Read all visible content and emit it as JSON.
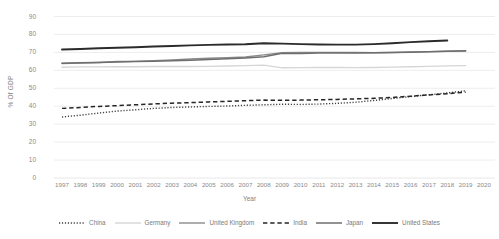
{
  "chart_data": {
    "type": "line",
    "title": "",
    "xlabel": "Year",
    "ylabel": "% Of GDP",
    "ylim": [
      0,
      90
    ],
    "ytick_step": 10,
    "grid": true,
    "legend_position": "bottom",
    "x": [
      1997,
      1998,
      1999,
      2000,
      2001,
      2002,
      2003,
      2004,
      2005,
      2006,
      2007,
      2008,
      2009,
      2010,
      2011,
      2012,
      2013,
      2014,
      2015,
      2016,
      2017,
      2018,
      2019,
      2020
    ],
    "xticks": [
      "1997",
      "1998",
      "1999",
      "2000",
      "2001",
      "2002",
      "2003",
      "2004",
      "2005",
      "2006",
      "2007",
      "2008",
      "2009",
      "2010",
      "2011",
      "2012",
      "2013",
      "2014",
      "2015",
      "2016",
      "2017",
      "2018",
      "2019",
      "2020"
    ],
    "yticks": [
      "0",
      "10",
      "20",
      "30",
      "40",
      "50",
      "60",
      "70",
      "80",
      "90"
    ],
    "series": [
      {
        "name": "China",
        "style": "dotted",
        "color": "#3f3f3f",
        "width": 1.4,
        "values": [
          34.0,
          35.0,
          36.2,
          37.3,
          38.0,
          38.8,
          39.3,
          39.6,
          39.9,
          40.1,
          40.5,
          40.8,
          41.1,
          41.0,
          41.2,
          41.6,
          42.2,
          43.2,
          44.3,
          45.4,
          46.4,
          47.4,
          48.6,
          null
        ]
      },
      {
        "name": "Germany",
        "style": "solid",
        "color": "#d6d6d6",
        "width": 1.4,
        "values": [
          61.7,
          61.9,
          61.9,
          62.0,
          62.0,
          62.1,
          62.1,
          62.1,
          62.2,
          62.4,
          62.6,
          62.9,
          61.4,
          61.5,
          61.6,
          61.6,
          61.5,
          61.6,
          61.8,
          62.0,
          62.2,
          62.5,
          62.6,
          null
        ]
      },
      {
        "name": "United Kingdom",
        "style": "solid",
        "color": "#8c8c8c",
        "width": 1.4,
        "values": [
          63.8,
          64.1,
          64.4,
          64.9,
          65.0,
          65.3,
          65.8,
          66.3,
          66.7,
          67.0,
          67.4,
          68.6,
          69.8,
          69.9,
          70.0,
          70.0,
          69.9,
          69.8,
          69.9,
          70.2,
          70.4,
          70.6,
          70.8,
          null
        ]
      },
      {
        "name": "India",
        "style": "dashed",
        "color": "#262626",
        "width": 1.5,
        "values": [
          38.8,
          39.3,
          39.9,
          40.3,
          40.8,
          41.3,
          41.7,
          42.0,
          42.4,
          42.7,
          43.1,
          43.4,
          43.3,
          43.4,
          43.6,
          43.8,
          44.1,
          44.4,
          44.9,
          45.6,
          46.3,
          47.0,
          47.8,
          null
        ]
      },
      {
        "name": "Japan",
        "style": "solid",
        "color": "#6e6e6e",
        "width": 1.5,
        "values": [
          64.0,
          64.2,
          64.4,
          64.7,
          64.9,
          65.1,
          65.3,
          65.6,
          66.0,
          66.4,
          66.9,
          67.6,
          69.5,
          69.4,
          69.6,
          69.7,
          69.7,
          69.8,
          69.9,
          70.1,
          70.4,
          70.7,
          70.9,
          null
        ]
      },
      {
        "name": "United States",
        "style": "solid",
        "color": "#2b2b2b",
        "width": 1.9,
        "values": [
          71.6,
          71.9,
          72.3,
          72.6,
          72.9,
          73.3,
          73.6,
          73.9,
          74.2,
          74.4,
          74.5,
          75.1,
          74.9,
          74.6,
          74.4,
          74.3,
          74.3,
          74.6,
          75.1,
          75.7,
          76.2,
          76.6,
          null,
          null
        ]
      }
    ]
  },
  "legend": {
    "items": [
      {
        "label": "China"
      },
      {
        "label": "Germany"
      },
      {
        "label": "United Kingdom"
      },
      {
        "label": "India"
      },
      {
        "label": "Japan"
      },
      {
        "label": "United States"
      }
    ]
  }
}
